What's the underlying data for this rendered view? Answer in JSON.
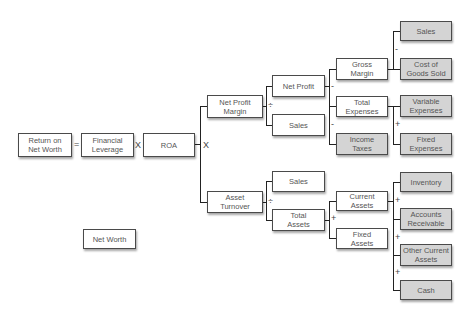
{
  "diagram": {
    "colors": {
      "node_fill": "#ffffff",
      "leaf_fill": "#d4d4d4",
      "border": "#4a4a4a",
      "connector": "#222222",
      "text": "#555555"
    },
    "nodes": {
      "return_on_net_worth": "Return on\nNet Worth",
      "financial_leverage": "Financial\nLeverage",
      "roa": "ROA",
      "net_worth": "Net Worth",
      "net_profit_margin": "Net Profit\nMargin",
      "asset_turnover": "Asset\nTurnover",
      "net_profit": "Net Profit",
      "sales_npm": "Sales",
      "sales_at": "Sales",
      "total_assets": "Total\nAssets",
      "gross_margin": "Gross\nMargin",
      "total_expenses": "Total\nExpenses",
      "income_taxes": "Income\nTaxes",
      "current_assets": "Current\nAssets",
      "fixed_assets": "Fixed\nAssets",
      "sales_gm": "Sales",
      "cost_of_goods_sold": "Cost of\nGoods Sold",
      "variable_expenses": "Variable\nExpenses",
      "fixed_expenses": "Fixed\nExpenses",
      "inventory": "Inventory",
      "accounts_receivable": "Accounts\nReceivable",
      "other_current_assets": "Other Current\nAssets",
      "cash": "Cash"
    },
    "operators": {
      "equals": "=",
      "times_1": "X",
      "times_2": "X",
      "divide_npm": "÷",
      "divide_at": "÷",
      "minus_np_1": "-",
      "minus_np_2": "-",
      "minus_gm": "-",
      "plus_te": "+",
      "plus_ta": "+",
      "plus_ca_1": "+",
      "plus_ca_2": "+",
      "plus_ca_3": "+"
    }
  }
}
